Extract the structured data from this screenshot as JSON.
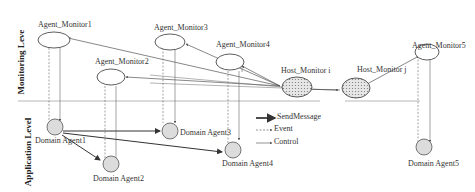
{
  "levels": {
    "monitoring": "Monitoring Leve",
    "application": "Application Level"
  },
  "monitors": [
    {
      "id": "m1",
      "label": "Agent_Monitor1"
    },
    {
      "id": "m2",
      "label": "Agent_Monitor2"
    },
    {
      "id": "m3",
      "label": "Agent_Monitor3"
    },
    {
      "id": "m4",
      "label": "Agent_Monitor4"
    },
    {
      "id": "m5",
      "label": "Agent_Monitor5"
    }
  ],
  "hosts": [
    {
      "id": "hi",
      "label": "Host_Monitor i"
    },
    {
      "id": "hj",
      "label": "Host_Monitor j"
    }
  ],
  "domain_agents": [
    {
      "id": "d1",
      "label": "Domain Agent1"
    },
    {
      "id": "d2",
      "label": "Domain Agent2"
    },
    {
      "id": "d3",
      "label": "Domain Agent3"
    },
    {
      "id": "d4",
      "label": "Domain Agent4"
    },
    {
      "id": "d5",
      "label": "Domain Agent5"
    }
  ],
  "legend": {
    "send": "SendMessage",
    "event": "Event",
    "control": "Control"
  }
}
